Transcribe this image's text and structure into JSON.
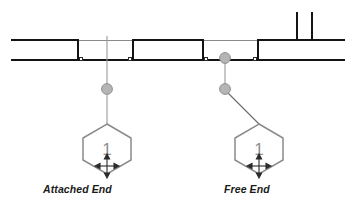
{
  "diagram": {
    "type": "floor-plan-detail",
    "background_color": "#ffffff",
    "line_color": "#1a1a1a",
    "thin_line_color": "#6e6e6e",
    "grip_fill": "#b3b3b3",
    "grip_stroke": "#8c8c8c",
    "balloon_stroke": "#808080",
    "balloon_text_color": "#8c8c8c",
    "leader_color": "#909090"
  },
  "labels": {
    "attached_end": "Attached End",
    "free_end": "Free End"
  },
  "tags": [
    {
      "id": "attached-end-tag",
      "value": "1",
      "shape": "hexagon",
      "move_symbol": "four-way-move-arrow"
    },
    {
      "id": "free-end-tag",
      "value": "1",
      "shape": "hexagon",
      "move_symbol": "four-way-move-arrow"
    }
  ],
  "grips": [
    {
      "id": "attached-leader-grip",
      "x": 107,
      "y": 89,
      "r": 5.5
    },
    {
      "id": "free-wall-grip",
      "x": 225,
      "y": 58,
      "r": 5.5
    },
    {
      "id": "free-leader-grip",
      "x": 225,
      "y": 89,
      "r": 5.5
    }
  ],
  "walls": {
    "top_line_y": 40,
    "bottom_line_y": 60,
    "left_edge_x": 11,
    "right_edge_x": 345,
    "segments": [
      {
        "id": "wall-segment-left",
        "x1": 11,
        "x2": 78
      },
      {
        "id": "wall-segment-selected-a",
        "x1": 78,
        "x2": 133
      },
      {
        "id": "wall-segment-selected-b",
        "x1": 133,
        "x2": 203
      },
      {
        "id": "wall-segment-selected-c",
        "x1": 203,
        "x2": 258
      },
      {
        "id": "wall-segment-right",
        "x1": 258,
        "x2": 345
      }
    ],
    "vertical_stubs": [
      {
        "id": "wall-stub-left",
        "x": 297,
        "y_top": 12,
        "y_bottom": 41
      },
      {
        "id": "wall-stub-right",
        "x": 312,
        "y_top": 12,
        "y_bottom": 41
      }
    ]
  }
}
